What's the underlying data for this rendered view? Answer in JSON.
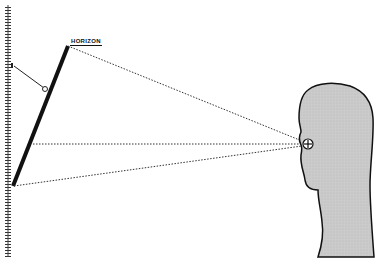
{
  "diagram": {
    "title": "",
    "labels": {
      "horizon": "HORIZON"
    },
    "elements": {
      "wall": {
        "x": 8,
        "y_top": 5,
        "y_bottom": 257,
        "hatched": true
      },
      "mirror": {
        "x1": 13,
        "y1": 186,
        "x2": 68,
        "y2": 46,
        "color": "#111111"
      },
      "support_arm": {
        "x1": 14,
        "y1": 66,
        "x2": 45,
        "y2": 89
      },
      "pivot": {
        "x": 45,
        "y": 89
      },
      "eye": {
        "x": 308,
        "y": 144,
        "symbol": "crosshair-circle"
      },
      "head_fill": "#c8c8c8",
      "sight_lines": [
        {
          "from": "eye",
          "to": [
            68,
            46
          ],
          "style": "dotted"
        },
        {
          "from": "eye",
          "to": [
            33,
            144
          ],
          "style": "dotted"
        },
        {
          "from": "eye",
          "to": [
            13,
            186
          ],
          "style": "dotted"
        }
      ]
    },
    "colors": {
      "background": "#ffffff",
      "ink": "#111111",
      "head": "#c8c8c8"
    }
  }
}
